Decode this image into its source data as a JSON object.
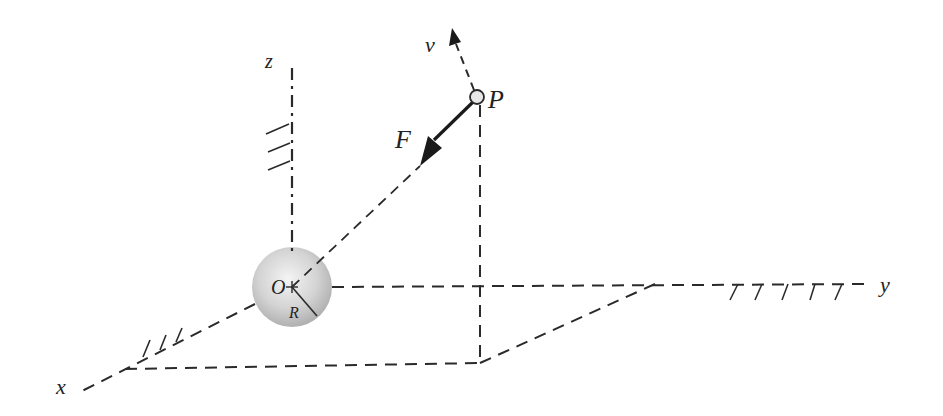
{
  "diagram": {
    "type": "3d-coordinate-mechanics-sketch",
    "labels": {
      "x_axis": "x",
      "y_axis": "y",
      "z_axis": "z",
      "origin": "O",
      "radius": "R",
      "point": "P",
      "force": "F",
      "velocity": "v"
    },
    "colors": {
      "line": "#2a2a2a",
      "sphere_light": "#f2f2f2",
      "sphere_dark": "#b5b5b5",
      "point_fill": "#e8e8e8",
      "background": "#ffffff"
    },
    "geometry": {
      "origin": [
        292,
        287
      ],
      "sphere_radius": 40,
      "point_P": [
        477,
        97
      ],
      "foot_P": [
        480,
        363
      ],
      "x_axis_end": [
        80,
        392
      ],
      "x_corner": [
        125,
        369
      ],
      "y_corner": [
        655,
        284
      ],
      "y_axis_end": [
        870,
        284
      ],
      "z_axis_top": [
        292,
        68
      ]
    }
  }
}
